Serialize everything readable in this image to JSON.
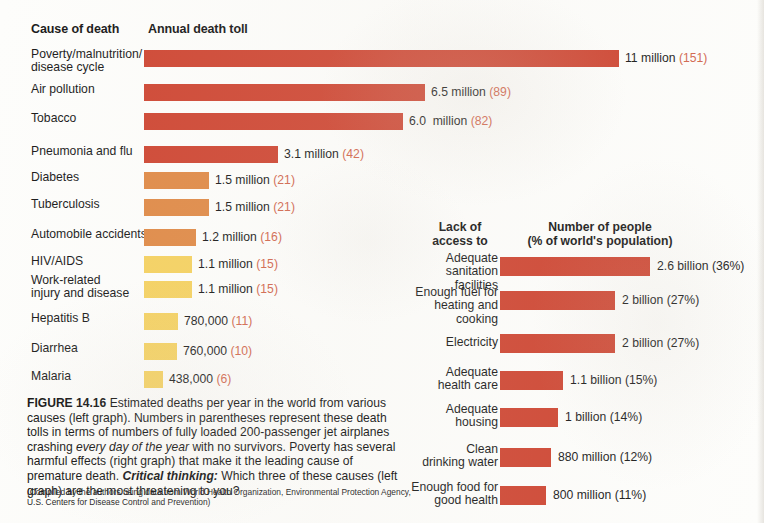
{
  "figure": {
    "number": "FIGURE 14.16",
    "caption_part1": " Estimated deaths per year in the world from various causes (left graph). Numbers in parentheses represent these death tolls in terms of numbers of fully loaded 200-passenger jet airplanes crashing ",
    "caption_italic": "every day of the year",
    "caption_part2": " with no survivors. Poverty has several harmful effects (right graph) that make it the leading cause of premature death. ",
    "critical_thinking_label": "Critical thinking:",
    "caption_part3": " Which three of these causes (left graph) are the most threatening to you?",
    "source": "(Compiled by the authors using data from World Health Organization, Environmental Protection Agency, U.S. Centers for Disease Control and Prevention)"
  },
  "colors": {
    "red": "#cf4936",
    "orange": "#e08c4a",
    "yellow": "#f5d263",
    "paren": "#d2684f"
  },
  "left_chart": {
    "header_category": "Cause of death",
    "header_value": "Annual death toll"
  },
  "right_chart": {
    "header_category": "Lack of\naccess to",
    "header_value": "Number of people\n(% of world's population)"
  },
  "chart_data": [
    {
      "type": "bar",
      "id": "annual-death-toll",
      "title": "Annual death toll",
      "xlabel": "Cause of death",
      "ylabel": "Annual death toll",
      "orientation": "horizontal",
      "unit": "deaths per year",
      "grid": false,
      "legend": "none",
      "categories": [
        "Poverty/malnutrition/\ndisease cycle",
        "Air pollution",
        "Tobacco",
        "Pneumonia and flu",
        "Diabetes",
        "Tuberculosis",
        "Automobile accidents",
        "HIV/AIDS",
        "Work-related\ninjury and disease",
        "Hepatitis B",
        "Diarrhea",
        "Malaria"
      ],
      "values": [
        11000000,
        6500000,
        6000000,
        3100000,
        1500000,
        1500000,
        1200000,
        1100000,
        1100000,
        780000,
        760000,
        438000
      ],
      "value_labels": [
        "11 million ",
        "6.5 million ",
        "6.0  million ",
        "3.1 million ",
        "1.5 million ",
        "1.5 million ",
        "1.2 million ",
        "1.1 million ",
        "1.1 million ",
        "780,000 ",
        "760,000 ",
        "438,000 "
      ],
      "paren_labels": [
        "(151)",
        "(89)",
        "(82)",
        "(42)",
        "(21)",
        "(21)",
        "(16)",
        "(15)",
        "(15)",
        "(11)",
        "(10)",
        "(6)"
      ],
      "bar_colors": [
        "#cf4936",
        "#cf4936",
        "#cf4936",
        "#cf4936",
        "#e08c4a",
        "#e08c4a",
        "#e08c4a",
        "#f5d263",
        "#f5d263",
        "#f5d263",
        "#f5d263",
        "#f5d263"
      ],
      "xlim": [
        0,
        11000000
      ]
    },
    {
      "type": "bar",
      "id": "lack-of-access",
      "title": "Number of people (% of world's population)",
      "xlabel": "Lack of access to",
      "ylabel": "Number of people",
      "orientation": "horizontal",
      "unit": "people",
      "grid": false,
      "legend": "none",
      "categories": [
        "Adequate\nsanitation facilities",
        "Enough fuel for\nheating and cooking",
        "Electricity",
        "Adequate\nhealth care",
        "Adequate\nhousing",
        "Clean\ndrinking water",
        "Enough food for\ngood health"
      ],
      "values": [
        2600000000,
        2000000000,
        2000000000,
        1100000000,
        1000000000,
        880000000,
        800000000
      ],
      "percents": [
        36,
        27,
        27,
        15,
        14,
        12,
        11
      ],
      "value_labels": [
        "2.6 billion (36%)",
        "2 billion (27%)",
        "2 billion (27%)",
        "1.1 billion (15%)",
        "1 billion (14%)",
        "880 million (12%)",
        "800 million (11%)"
      ],
      "bar_colors": [
        "#cf4936",
        "#cf4936",
        "#cf4936",
        "#cf4936",
        "#cf4936",
        "#cf4936",
        "#cf4936"
      ],
      "xlim": [
        0,
        2600000000
      ]
    }
  ]
}
